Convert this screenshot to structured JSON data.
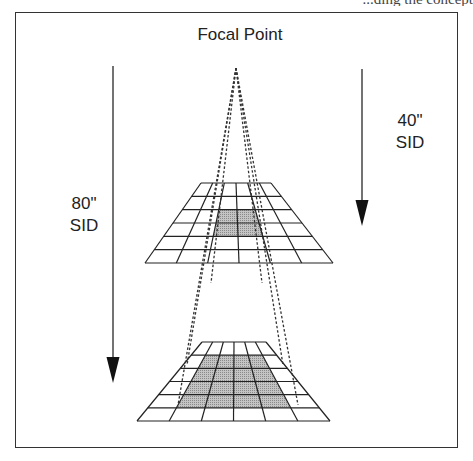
{
  "page": {
    "clipped_header_text": "...ding the concept"
  },
  "diagram": {
    "title": "Focal Point",
    "labels": {
      "sid_80": [
        "80\"",
        "SID"
      ],
      "sid_40": [
        "40\"",
        "SID"
      ]
    },
    "focal_point": {
      "x": 236,
      "y": 68
    },
    "arrows": [
      {
        "name": "arrow-80-sid",
        "x": 113,
        "y1": 66,
        "y2": 383,
        "head_len": 26,
        "head_w": 13
      },
      {
        "name": "arrow-40-sid",
        "x": 362,
        "y1": 69,
        "y2": 226,
        "head_len": 26,
        "head_w": 13
      }
    ],
    "grids": [
      {
        "name": "upper-grid-40-sid",
        "top_y": 183,
        "bottom_y": 263,
        "top_x": [
          201,
          271
        ],
        "bottom_x": [
          145,
          333
        ],
        "cols": 6,
        "rows": 6,
        "shaded": {
          "col_from": 2,
          "col_to": 4,
          "row_from": 2,
          "row_to": 4
        }
      },
      {
        "name": "lower-grid-80-sid",
        "top_y": 342,
        "bottom_y": 421,
        "top_x": [
          202,
          266
        ],
        "bottom_x": [
          137,
          330
        ],
        "cols": 6,
        "rows": 6,
        "shaded": {
          "col_from": 1,
          "col_to": 5,
          "row_from": 1,
          "row_to": 5
        }
      }
    ],
    "projection_lines": [
      {
        "name": "outer-left-ray",
        "to": {
          "x": 178,
          "y": 405
        }
      },
      {
        "name": "inner-left-ray",
        "to": {
          "x": 211,
          "y": 283
        }
      },
      {
        "name": "inner-right-ray",
        "to": {
          "x": 262,
          "y": 283
        }
      },
      {
        "name": "outer-right-ray",
        "to": {
          "x": 298,
          "y": 405
        }
      },
      {
        "name": "mid-left-ray",
        "to": {
          "x": 187,
          "y": 365
        }
      },
      {
        "name": "mid-right-ray",
        "to": {
          "x": 283,
          "y": 365
        }
      }
    ],
    "colors": {
      "line": "#222222",
      "shade": "#a8a8a8",
      "dash": "#333333",
      "frame": "#333333"
    }
  }
}
